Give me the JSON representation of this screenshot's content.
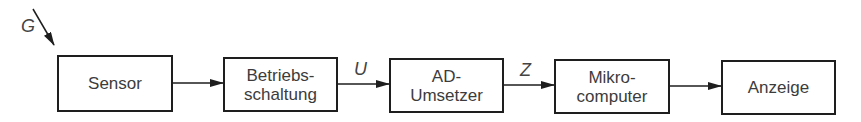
{
  "diagram": {
    "input_label": "G",
    "blocks": [
      {
        "id": "sensor",
        "lines": [
          "Sensor"
        ]
      },
      {
        "id": "betriebsschaltung",
        "lines": [
          "Betriebs-",
          "schaltung"
        ]
      },
      {
        "id": "ad_umsetzer",
        "lines": [
          "AD-",
          "Umsetzer"
        ]
      },
      {
        "id": "mikrocomputer",
        "lines": [
          "Mikro-",
          "computer"
        ]
      },
      {
        "id": "anzeige",
        "lines": [
          "Anzeige"
        ]
      }
    ],
    "signals": [
      {
        "between": [
          "sensor",
          "betriebsschaltung"
        ],
        "label": ""
      },
      {
        "between": [
          "betriebsschaltung",
          "ad_umsetzer"
        ],
        "label": "U"
      },
      {
        "between": [
          "ad_umsetzer",
          "mikrocomputer"
        ],
        "label": "Z"
      },
      {
        "between": [
          "mikrocomputer",
          "anzeige"
        ],
        "label": ""
      }
    ],
    "colors": {
      "line": "#1e1e1e",
      "text": "#3c3c3c",
      "background": "#ffffff"
    }
  }
}
